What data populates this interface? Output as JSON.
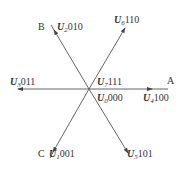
{
  "diagram": {
    "type": "space-vector-hexagon",
    "center": {
      "x": 89,
      "y": 89
    },
    "line_color": "#555555",
    "text_color": "#333333",
    "axes": [
      {
        "id": "A",
        "label": "A"
      },
      {
        "id": "B",
        "label": "B"
      },
      {
        "id": "C",
        "label": "C"
      }
    ],
    "vectors": [
      {
        "id": "u1",
        "symbol": "U",
        "index": "1",
        "code": "001",
        "direction": "down-left"
      },
      {
        "id": "u2",
        "symbol": "U",
        "index": "2",
        "code": "010",
        "direction": "up-left"
      },
      {
        "id": "u3",
        "symbol": "U",
        "index": "3",
        "code": "011",
        "direction": "left"
      },
      {
        "id": "u4",
        "symbol": "U",
        "index": "4",
        "code": "100",
        "direction": "right"
      },
      {
        "id": "u5",
        "symbol": "U",
        "index": "5",
        "code": "101",
        "direction": "down-right"
      },
      {
        "id": "u6",
        "symbol": "U",
        "index": "6",
        "code": "110",
        "direction": "up-right"
      },
      {
        "id": "u7",
        "symbol": "U",
        "index": "7",
        "code": "111",
        "direction": "zero"
      },
      {
        "id": "u0",
        "symbol": "U",
        "index": "0",
        "code": "000",
        "direction": "zero"
      }
    ]
  }
}
